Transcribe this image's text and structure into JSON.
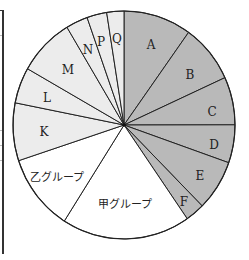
{
  "chart_data": {
    "type": "pie",
    "title": "",
    "start_angle_deg": 0,
    "direction": "clockwise",
    "slices": [
      {
        "label": "A",
        "value": 9.9,
        "color": "#b9b9b9",
        "group": "dark"
      },
      {
        "label": "B",
        "value": 8.3,
        "color": "#b9b9b9",
        "group": "dark"
      },
      {
        "label": "C",
        "value": 6.8,
        "color": "#b9b9b9",
        "group": "dark"
      },
      {
        "label": "D",
        "value": 5.4,
        "color": "#b9b9b9",
        "group": "dark"
      },
      {
        "label": "E",
        "value": 7.2,
        "color": "#b9b9b9",
        "group": "dark"
      },
      {
        "label": "F",
        "value": 2.8,
        "color": "#b9b9b9",
        "group": "dark"
      },
      {
        "label": "甲グループ",
        "value": 18.7,
        "color": "#ffffff",
        "group": "white"
      },
      {
        "label": "乙グループ",
        "value": 10.9,
        "color": "#ffffff",
        "group": "white"
      },
      {
        "label": "K",
        "value": 8.2,
        "color": "#ececec",
        "group": "light"
      },
      {
        "label": "L",
        "value": 5.1,
        "color": "#ececec",
        "group": "light"
      },
      {
        "label": "M",
        "value": 8.2,
        "color": "#ececec",
        "group": "light"
      },
      {
        "label": "N",
        "value": 3.2,
        "color": "#ececec",
        "group": "light"
      },
      {
        "label": "P",
        "value": 2.9,
        "color": "#ececec",
        "group": "light"
      },
      {
        "label": "Q",
        "value": 2.5,
        "color": "#ececec",
        "group": "light"
      }
    ],
    "categories": [
      "A",
      "B",
      "C",
      "D",
      "E",
      "F",
      "甲グループ",
      "乙グループ",
      "K",
      "L",
      "M",
      "N",
      "P",
      "Q"
    ],
    "values": [
      9.9,
      8.3,
      6.8,
      5.4,
      7.2,
      2.8,
      18.7,
      10.9,
      8.2,
      5.1,
      8.2,
      3.2,
      2.9,
      2.5
    ],
    "legend": "none",
    "stroke_color": "#222222"
  },
  "layout": {
    "cx": 124,
    "cy": 125,
    "rx": 111,
    "ry": 114,
    "label_positions": {
      "A": [
        151,
        45
      ],
      "B": [
        190,
        75
      ],
      "C": [
        212,
        112
      ],
      "D": [
        214,
        145
      ],
      "E": [
        200,
        176
      ],
      "F": [
        184,
        202
      ],
      "甲グループ": [
        125,
        205
      ],
      "乙グループ": [
        57,
        178
      ],
      "K": [
        44,
        132
      ],
      "L": [
        47,
        98
      ],
      "M": [
        68,
        70
      ],
      "N": [
        88,
        50
      ],
      "P": [
        101,
        42
      ],
      "Q": [
        117,
        39
      ]
    }
  }
}
